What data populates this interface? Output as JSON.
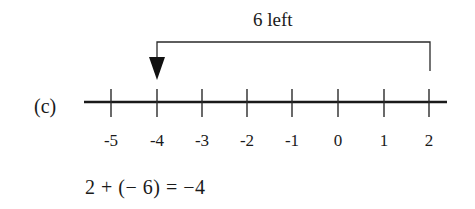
{
  "diagram": {
    "part_label": "(c)",
    "jump_label": "6 left",
    "equation": "2 + (− 6) = −4",
    "number_line": {
      "ticks": [
        {
          "value": -5,
          "label": "-5",
          "x": 111
        },
        {
          "value": -4,
          "label": "-4",
          "x": 157
        },
        {
          "value": -3,
          "label": "-3",
          "x": 202
        },
        {
          "value": -2,
          "label": "-2",
          "x": 247
        },
        {
          "value": -1,
          "label": "-1",
          "x": 292
        },
        {
          "value": 0,
          "label": "0",
          "x": 338
        },
        {
          "value": 1,
          "label": "1",
          "x": 384
        },
        {
          "value": 2,
          "label": "2",
          "x": 429
        }
      ],
      "start_value": 2,
      "end_value": -4,
      "jump": -6
    },
    "colors": {
      "ink": "#1a1a1a",
      "background": "#ffffff"
    }
  }
}
